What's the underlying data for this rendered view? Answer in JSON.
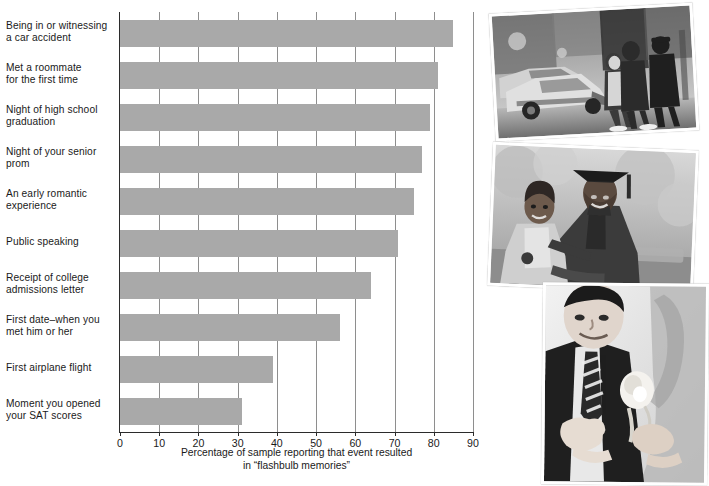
{
  "chart_data": {
    "type": "bar",
    "orientation": "horizontal",
    "title": "",
    "subtitle": "",
    "xlabel": "Percentage of sample reporting that event resulted in “flashbulb memories”",
    "ylabel": "",
    "xlim": [
      0,
      90
    ],
    "xticks": [
      0,
      10,
      20,
      30,
      40,
      50,
      60,
      70,
      80,
      90
    ],
    "xtick_labels": [
      "0",
      "10",
      "20",
      "30",
      "40",
      "50",
      "60",
      "70",
      "80",
      "90"
    ],
    "grid": "vertical",
    "legend": "none",
    "bar_color": "#a9a9a9",
    "categories": [
      "Being in or witnessing a car accident",
      "Met a roommate for the first time",
      "Night of high school graduation",
      "Night of your senior prom",
      "An early romantic experience",
      "Public speaking",
      "Receipt of college admissions letter",
      "First date–when you met him or her",
      "First airplane flight",
      "Moment you opened your SAT scores"
    ],
    "category_lines": [
      [
        "Being in or witnessing",
        "a car accident"
      ],
      [
        "Met a roommate",
        "for the first time"
      ],
      [
        "Night of high school",
        "graduation"
      ],
      [
        "Night of your senior",
        "prom"
      ],
      [
        "An early romantic",
        "experience"
      ],
      [
        "Public speaking"
      ],
      [
        "Receipt of college",
        "admissions letter"
      ],
      [
        "First date–when you",
        "met him or her"
      ],
      [
        "First airplane flight"
      ],
      [
        "Moment you opened",
        "your SAT scores"
      ]
    ],
    "values": [
      85,
      81,
      79,
      77,
      75,
      71,
      64,
      56,
      39,
      31
    ]
  },
  "xaxis_caption": {
    "line1": "Percentage of sample reporting that event resulted",
    "line2": "in “flashbulb memories”"
  },
  "collage": {
    "photos": [
      {
        "name": "car-accident-photo",
        "alt": "Black and white photo of a damaged car at a street accident scene with people and a police officer standing nearby"
      },
      {
        "name": "graduation-photo",
        "alt": "Black and white photo of a smiling graduate in cap and gown embracing an older woman outdoors"
      },
      {
        "name": "prom-photo",
        "alt": "Black and white photo of a young man in a suit and striped tie having a white rose boutonniere pinned on"
      }
    ]
  }
}
